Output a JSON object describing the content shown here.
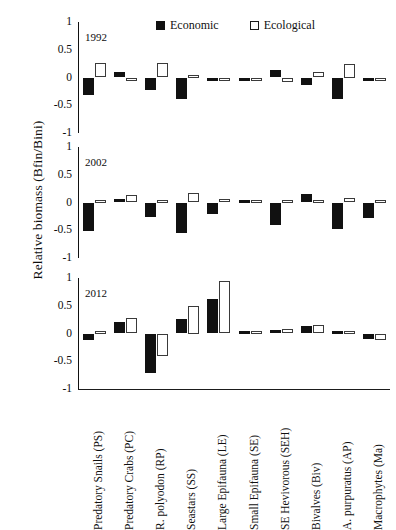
{
  "axis": {
    "ylabel": "Relative biomass  (Bfin/Bini)",
    "yticks": [
      "1",
      "0.5",
      "0",
      "-0.5",
      "-1"
    ]
  },
  "legend": {
    "items": [
      {
        "label": "Economic",
        "swatch": "filled-square",
        "color": "#111111"
      },
      {
        "label": "Ecological",
        "swatch": "open-square",
        "color": "#ffffff"
      }
    ]
  },
  "panels": [
    {
      "label": "1992"
    },
    {
      "label": "2002"
    },
    {
      "label": "2012"
    }
  ],
  "chart_data": {
    "type": "bar",
    "title": "",
    "xlabel": "",
    "ylabel": "Relative biomass  (Bfin/Bini)",
    "ylim": [
      -1,
      1
    ],
    "yticks": [
      1,
      0.5,
      0,
      -0.5,
      -1
    ],
    "grid": false,
    "legend_position": "top-center",
    "categories": [
      "Predatory Snails (PS)",
      "Predatory Crabs (PC)",
      "R. polyodon (RP)",
      "Seastars (SS)",
      "Large Epifauna (LE)",
      "Small Epifauna (SE)",
      "SE Hevivorous (SEH)",
      "Bivalves (Biv)",
      "A. purpuratus (AP)",
      "Macrophytes (Ma)"
    ],
    "panels": [
      {
        "label": "1992",
        "series": [
          {
            "name": "Economic",
            "values": [
              -0.32,
              0.1,
              -0.22,
              -0.38,
              -0.01,
              -0.05,
              0.13,
              -0.14,
              -0.38,
              -0.02
            ]
          },
          {
            "name": "Ecological",
            "values": [
              0.27,
              -0.07,
              0.27,
              0.03,
              -0.01,
              -0.03,
              -0.08,
              0.1,
              0.25,
              -0.01
            ]
          }
        ]
      },
      {
        "label": "2002",
        "series": [
          {
            "name": "Economic",
            "values": [
              -0.52,
              0.06,
              -0.27,
              -0.55,
              -0.2,
              0.0,
              -0.4,
              0.15,
              -0.48,
              -0.28
            ]
          },
          {
            "name": "Ecological",
            "values": [
              0.02,
              0.13,
              0.0,
              0.18,
              0.06,
              0.0,
              0.02,
              0.04,
              0.09,
              0.02
            ]
          }
        ]
      },
      {
        "label": "2012",
        "series": [
          {
            "name": "Economic",
            "values": [
              -0.12,
              0.2,
              -0.72,
              0.27,
              0.62,
              0.03,
              0.06,
              0.13,
              0.0,
              -0.1
            ]
          },
          {
            "name": "Ecological",
            "values": [
              0.01,
              0.28,
              -0.4,
              0.5,
              0.95,
              0.0,
              0.08,
              0.15,
              0.0,
              -0.12
            ]
          }
        ]
      }
    ]
  }
}
